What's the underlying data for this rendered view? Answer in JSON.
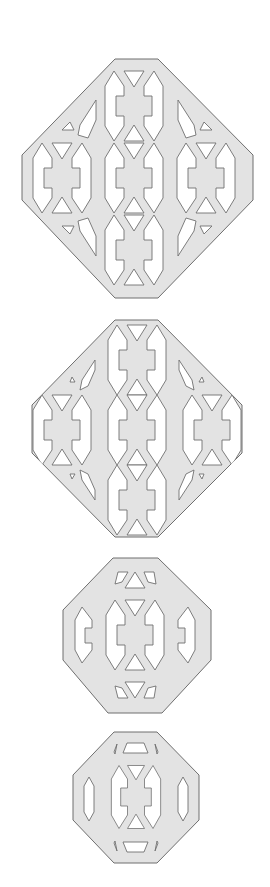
{
  "figure": {
    "colors": {
      "fill": "#e3e3e3",
      "stroke": "#6f6f6f",
      "background": "#ffffff"
    },
    "tiles": [
      {
        "name": "tile-1",
        "label": "Large diamond lattice tile (5 motifs)"
      },
      {
        "name": "tile-2",
        "label": "Large diamond lattice tile variant (5 motifs)"
      },
      {
        "name": "tile-3",
        "label": "Medium octagonal lattice tile (1 motif + side holes)"
      },
      {
        "name": "tile-4",
        "label": "Small octagonal lattice tile (1 motif + side slots)"
      }
    ]
  }
}
